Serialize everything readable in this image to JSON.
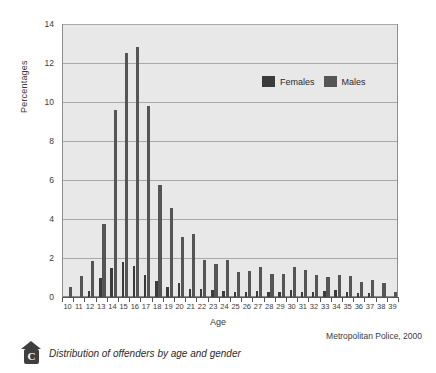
{
  "chart_data": {
    "type": "bar",
    "title": "",
    "xlabel": "Age",
    "ylabel": "Percentages",
    "ylim": [
      0,
      14
    ],
    "ytick_step": 2,
    "yticks": [
      0,
      2,
      4,
      6,
      8,
      10,
      12,
      14
    ],
    "grid": "horizontal",
    "legend_position": "inside-top-right",
    "categories": [
      10,
      11,
      12,
      13,
      14,
      15,
      16,
      17,
      18,
      19,
      20,
      21,
      22,
      23,
      24,
      25,
      26,
      27,
      28,
      29,
      30,
      31,
      32,
      33,
      34,
      35,
      36,
      37,
      38,
      39
    ],
    "series": [
      {
        "name": "Females",
        "color": "#3b3b3b",
        "values": [
          0.0,
          0.0,
          0.3,
          1.0,
          1.5,
          1.8,
          1.6,
          1.15,
          0.8,
          0.5,
          0.7,
          0.4,
          0.4,
          0.35,
          0.3,
          0.25,
          0.25,
          0.3,
          0.25,
          0.25,
          0.35,
          0.25,
          0.25,
          0.3,
          0.35,
          0.25,
          0.2,
          0.2,
          0.0,
          0.0
        ]
      },
      {
        "name": "Males",
        "color": "#555555",
        "values": [
          0.5,
          1.1,
          1.85,
          3.75,
          9.6,
          12.5,
          12.8,
          9.8,
          5.75,
          4.55,
          3.1,
          3.25,
          1.9,
          1.7,
          1.9,
          1.3,
          1.35,
          1.55,
          1.2,
          1.2,
          1.55,
          1.4,
          1.15,
          1.05,
          1.15,
          1.1,
          0.75,
          0.85,
          0.7,
          0.25
        ]
      }
    ]
  },
  "axes": {
    "y_title": "Percentages",
    "x_title": "Age",
    "y_tick_labels": [
      "14",
      "12",
      "10",
      "8",
      "6",
      "4",
      "2",
      "0"
    ],
    "x_tick_labels": [
      "10",
      "11",
      "12",
      "13",
      "14",
      "15",
      "16",
      "17",
      "18",
      "19",
      "20",
      "21",
      "22",
      "23",
      "24",
      "25",
      "26",
      "27",
      "28",
      "29",
      "30",
      "31",
      "32",
      "33",
      "34",
      "35",
      "36",
      "37",
      "38",
      "39"
    ]
  },
  "legend": {
    "items": [
      {
        "label": "Females",
        "color": "#3b3b3b"
      },
      {
        "label": "Males",
        "color": "#555555"
      }
    ]
  },
  "source_note": "Metropolitan Police, 2000",
  "caption": {
    "badge_letter": "C",
    "text": "Distribution of offenders by age and gender"
  },
  "colors": {
    "plot_background": "#e8e8e8",
    "grid": "#a9a9a9",
    "frame": "#8d8d8d",
    "female": "#3b3b3b",
    "male": "#555555",
    "text": "#2b2b2b"
  }
}
